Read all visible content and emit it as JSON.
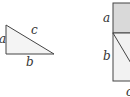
{
  "diagram": {
    "triangle": {
      "labels": {
        "a": "a",
        "b": "b",
        "c": "c"
      }
    },
    "square_figure": {
      "labels": {
        "left_top": "a",
        "left_bottom": "b",
        "bottom": "c"
      },
      "shade_color": "#d9d9d9",
      "fill_color": "#f2f2f2",
      "stroke_color": "#444444"
    }
  }
}
